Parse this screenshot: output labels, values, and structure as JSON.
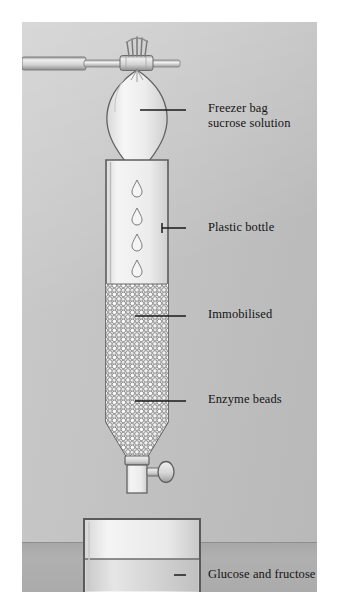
{
  "figure": {
    "background_color": "#c4c4c4",
    "bench_color": "#ababab",
    "label_color": "#141414",
    "line_color": "#1a1a1a"
  },
  "labels": {
    "bag_line1": "Freezer bag",
    "bag_line2": "sucrose solution",
    "bottle": "Plastic bottle",
    "immobilised": "Immobilised",
    "enzyme_beads": "Enzyme beads",
    "product": "Glucose and fructose"
  },
  "apparatus": {
    "clamp": "clamp-stand-arm",
    "clip": "bag-neck-clip",
    "bag": "freezer-bag-sucrose-solution",
    "drips": 4,
    "bottle": "plastic-bottle-column",
    "beads": "immobilised-enzyme-beads",
    "tap": "outlet-tap",
    "beaker": "collection-beaker",
    "liquid": "glucose-and-fructose-solution"
  }
}
